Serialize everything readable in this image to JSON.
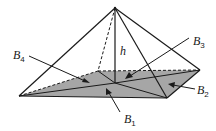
{
  "diagram": {
    "type": "rectangular-pyramid",
    "colors": {
      "base_fill": "#a6a6a6",
      "line": "#1a1a1a",
      "background": "#ffffff"
    },
    "labels": {
      "height": "h",
      "b1": {
        "letter": "B",
        "sub": "1"
      },
      "b2": {
        "letter": "B",
        "sub": "2"
      },
      "b3": {
        "letter": "B",
        "sub": "3"
      },
      "b4": {
        "letter": "B",
        "sub": "4"
      }
    }
  }
}
